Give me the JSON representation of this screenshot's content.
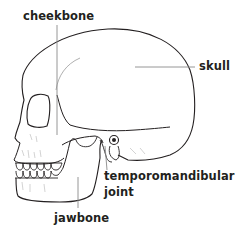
{
  "diagram": {
    "colors": {
      "outline": "#231f20",
      "leader_line": "#8a8a8a",
      "label_text": "#231f20",
      "background": "#ffffff"
    },
    "labels": [
      {
        "id": "cheekbone",
        "text": "cheekbone"
      },
      {
        "id": "skull",
        "text": "skull"
      },
      {
        "id": "tmj",
        "text_line1": "temporomandibular",
        "text_line2": "joint"
      },
      {
        "id": "jawbone",
        "text": "jawbone"
      }
    ]
  }
}
